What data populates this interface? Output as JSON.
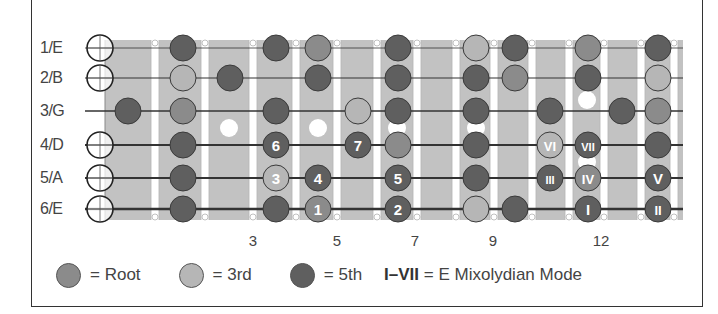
{
  "strings": [
    {
      "label": "1/E",
      "y": 48
    },
    {
      "label": "2/B",
      "y": 78
    },
    {
      "label": "3/G",
      "y": 111
    },
    {
      "label": "4/D",
      "y": 145
    },
    {
      "label": "5/A",
      "y": 178
    },
    {
      "label": "6/E",
      "y": 209
    }
  ],
  "open_strings": [
    0,
    1,
    3,
    4,
    5
  ],
  "fret_wires_x": [
    105,
    155,
    205,
    253,
    296,
    337,
    377,
    417,
    456,
    494,
    532,
    569,
    604,
    641,
    674
  ],
  "shaded_columns": [
    {
      "x0": 105,
      "x1": 150
    },
    {
      "x0": 160,
      "x1": 200
    },
    {
      "x0": 210,
      "x1": 248
    },
    {
      "x0": 258,
      "x1": 291
    },
    {
      "x0": 301,
      "x1": 332
    },
    {
      "x0": 342,
      "x1": 372
    },
    {
      "x0": 382,
      "x1": 412
    },
    {
      "x0": 422,
      "x1": 451
    },
    {
      "x0": 461,
      "x1": 489
    },
    {
      "x0": 499,
      "x1": 527
    },
    {
      "x0": 537,
      "x1": 564
    },
    {
      "x0": 574,
      "x1": 599
    },
    {
      "x0": 609,
      "x1": 636
    },
    {
      "x0": 646,
      "x1": 669
    },
    {
      "x0": 679,
      "x1": 683
    }
  ],
  "inlays": [
    {
      "x": 229,
      "y": 128
    },
    {
      "x": 318,
      "y": 128
    },
    {
      "x": 397,
      "y": 128
    },
    {
      "x": 476,
      "y": 128
    },
    {
      "x": 587,
      "y": 100
    },
    {
      "x": 587,
      "y": 162
    }
  ],
  "colors": {
    "root": "#8b8b8b",
    "third": "#b6b6b6",
    "fifth": "#5f5f5f",
    "board": "#cdcdcd",
    "board_band": "#c2c2c2",
    "fret_wire": "#ffffff",
    "string": "#333333"
  },
  "dots": [
    {
      "s": 0,
      "x": 183,
      "t": "fifth"
    },
    {
      "s": 0,
      "x": 276,
      "t": "fifth"
    },
    {
      "s": 0,
      "x": 318,
      "t": "root"
    },
    {
      "s": 0,
      "x": 398,
      "t": "fifth"
    },
    {
      "s": 0,
      "x": 476,
      "t": "third"
    },
    {
      "s": 0,
      "x": 515,
      "t": "fifth"
    },
    {
      "s": 0,
      "x": 588,
      "t": "root"
    },
    {
      "s": 0,
      "x": 658,
      "t": "fifth"
    },
    {
      "s": 1,
      "x": 183,
      "t": "third"
    },
    {
      "s": 1,
      "x": 230,
      "t": "fifth"
    },
    {
      "s": 1,
      "x": 318,
      "t": "fifth"
    },
    {
      "s": 1,
      "x": 398,
      "t": "fifth"
    },
    {
      "s": 1,
      "x": 476,
      "t": "fifth"
    },
    {
      "s": 1,
      "x": 515,
      "t": "root"
    },
    {
      "s": 1,
      "x": 588,
      "t": "fifth"
    },
    {
      "s": 1,
      "x": 658,
      "t": "third"
    },
    {
      "s": 2,
      "x": 128,
      "t": "fifth"
    },
    {
      "s": 2,
      "x": 183,
      "t": "root"
    },
    {
      "s": 2,
      "x": 276,
      "t": "fifth"
    },
    {
      "s": 2,
      "x": 358,
      "t": "third"
    },
    {
      "s": 2,
      "x": 398,
      "t": "fifth"
    },
    {
      "s": 2,
      "x": 476,
      "t": "fifth"
    },
    {
      "s": 2,
      "x": 550,
      "t": "fifth"
    },
    {
      "s": 2,
      "x": 622,
      "t": "fifth"
    },
    {
      "s": 2,
      "x": 658,
      "t": "root"
    },
    {
      "s": 3,
      "x": 183,
      "t": "fifth"
    },
    {
      "s": 3,
      "x": 276,
      "t": "fifth",
      "label": "6"
    },
    {
      "s": 3,
      "x": 358,
      "t": "fifth",
      "label": "7"
    },
    {
      "s": 3,
      "x": 398,
      "t": "root"
    },
    {
      "s": 3,
      "x": 476,
      "t": "fifth"
    },
    {
      "s": 3,
      "x": 550,
      "t": "third",
      "label": "VI"
    },
    {
      "s": 3,
      "x": 588,
      "t": "fifth",
      "label": "VII"
    },
    {
      "s": 3,
      "x": 658,
      "t": "fifth"
    },
    {
      "s": 4,
      "x": 183,
      "t": "fifth"
    },
    {
      "s": 4,
      "x": 276,
      "t": "third",
      "label": "3"
    },
    {
      "s": 4,
      "x": 318,
      "t": "fifth",
      "label": "4"
    },
    {
      "s": 4,
      "x": 398,
      "t": "fifth",
      "label": "5"
    },
    {
      "s": 4,
      "x": 476,
      "t": "fifth"
    },
    {
      "s": 4,
      "x": 550,
      "t": "fifth",
      "label": "III"
    },
    {
      "s": 4,
      "x": 588,
      "t": "root",
      "label": "IV"
    },
    {
      "s": 4,
      "x": 658,
      "t": "fifth",
      "label": "V"
    },
    {
      "s": 5,
      "x": 183,
      "t": "fifth"
    },
    {
      "s": 5,
      "x": 276,
      "t": "fifth"
    },
    {
      "s": 5,
      "x": 318,
      "t": "root",
      "label": "1"
    },
    {
      "s": 5,
      "x": 398,
      "t": "fifth",
      "label": "2"
    },
    {
      "s": 5,
      "x": 476,
      "t": "third"
    },
    {
      "s": 5,
      "x": 515,
      "t": "fifth"
    },
    {
      "s": 5,
      "x": 588,
      "t": "fifth",
      "label": "I"
    },
    {
      "s": 5,
      "x": 658,
      "t": "fifth",
      "label": "II"
    }
  ],
  "fret_numbers": [
    {
      "label": "3",
      "x": 253
    },
    {
      "label": "5",
      "x": 337
    },
    {
      "label": "7",
      "x": 415
    },
    {
      "label": "9",
      "x": 493
    },
    {
      "label": "12",
      "x": 601
    }
  ],
  "legend": {
    "root_label": "= Root",
    "third_label": "= 3rd",
    "fifth_label": "= 5th",
    "mode_bold": "I–VII",
    "mode_text": " = E Mixolydian Mode"
  }
}
